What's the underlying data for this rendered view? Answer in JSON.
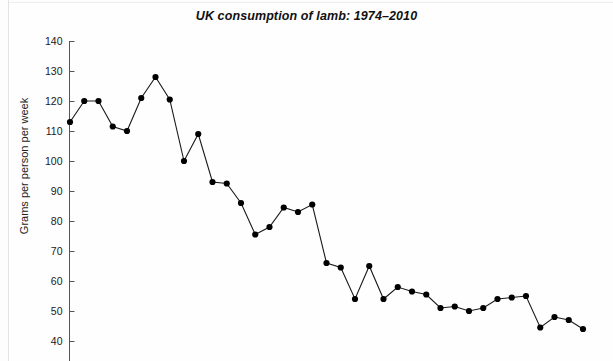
{
  "page": {
    "background_color": "#fdfdfd",
    "frame_color": "#e3e3e3"
  },
  "chart_data": {
    "type": "line",
    "title": "UK consumption of lamb: 1974–2010",
    "xlabel": "",
    "ylabel": "Grams per person per week",
    "ylim": [
      40,
      140
    ],
    "yticks": [
      40,
      50,
      60,
      70,
      80,
      90,
      100,
      110,
      120,
      130,
      140
    ],
    "ytick_labels": [
      "40",
      "50",
      "60",
      "70",
      "80",
      "90",
      "100",
      "110",
      "120",
      "130",
      "140"
    ],
    "xlim": [
      1974,
      2010
    ],
    "xticks": [],
    "xtick_labels": [],
    "grid": false,
    "legend": null,
    "marker": "filled-circle",
    "line_color": "#1a1a1a",
    "marker_color": "#000000",
    "categories": [
      1974,
      1975,
      1976,
      1977,
      1978,
      1979,
      1980,
      1981,
      1982,
      1983,
      1984,
      1985,
      1986,
      1987,
      1988,
      1989,
      1990,
      1991,
      1992,
      1993,
      1994,
      1995,
      1996,
      1997,
      1998,
      1999,
      2000,
      2001,
      2002,
      2003,
      2004,
      2005,
      2006,
      2007,
      2008,
      2009,
      2010
    ],
    "values": [
      113,
      120,
      120,
      111.5,
      110,
      121,
      128,
      120.5,
      100,
      109,
      93,
      92.5,
      86,
      75.5,
      78,
      84.5,
      83,
      85.5,
      66,
      64.5,
      54,
      65,
      54,
      58,
      56.5,
      55.5,
      51,
      51.5,
      50,
      51,
      54,
      54.5,
      55,
      44.5,
      48,
      47,
      44
    ],
    "units": "grams per person per week"
  },
  "title_style": {
    "italic": true,
    "bold": true
  }
}
